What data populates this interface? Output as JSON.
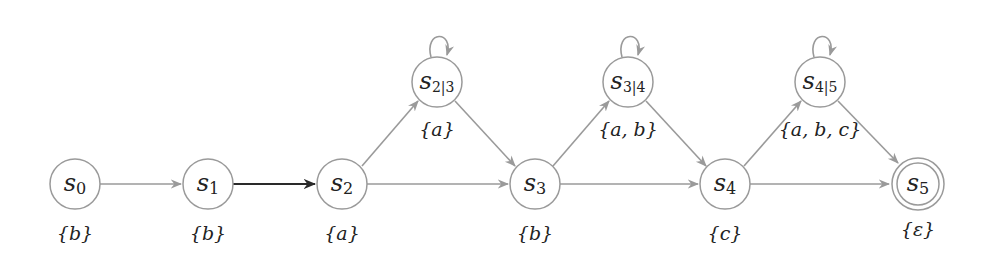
{
  "diagram": {
    "type": "state-automaton",
    "nodes": [
      {
        "id": "s0",
        "base": "s",
        "sub": "0",
        "set": "{b}",
        "x": 75,
        "y": 184,
        "accepting": false
      },
      {
        "id": "s1",
        "base": "s",
        "sub": "1",
        "set": "{b}",
        "x": 208,
        "y": 184,
        "accepting": false
      },
      {
        "id": "s2",
        "base": "s",
        "sub": "2",
        "set": "{a}",
        "x": 342,
        "y": 184,
        "accepting": false
      },
      {
        "id": "s2|3",
        "base": "s",
        "sub": "2|3",
        "set": "{a}",
        "x": 437,
        "y": 82,
        "accepting": false,
        "self_loop": true
      },
      {
        "id": "s3",
        "base": "s",
        "sub": "3",
        "set": "{b}",
        "x": 535,
        "y": 184,
        "accepting": false
      },
      {
        "id": "s3|4",
        "base": "s",
        "sub": "3|4",
        "set": "{a, b}",
        "x": 628,
        "y": 82,
        "accepting": false,
        "self_loop": true
      },
      {
        "id": "s4",
        "base": "s",
        "sub": "4",
        "set": "{c}",
        "x": 725,
        "y": 184,
        "accepting": false
      },
      {
        "id": "s4|5",
        "base": "s",
        "sub": "4|5",
        "set": "{a, b, c}",
        "x": 820,
        "y": 82,
        "accepting": false,
        "self_loop": true
      },
      {
        "id": "s5",
        "base": "s",
        "sub": "5",
        "set": "{ε}",
        "x": 918,
        "y": 184,
        "accepting": true
      }
    ],
    "edges": [
      {
        "from": "s0",
        "to": "s1",
        "style": "gray"
      },
      {
        "from": "s1",
        "to": "s2",
        "style": "dark"
      },
      {
        "from": "s2",
        "to": "s2|3",
        "style": "gray"
      },
      {
        "from": "s2",
        "to": "s3",
        "style": "gray"
      },
      {
        "from": "s2|3",
        "to": "s3",
        "style": "gray"
      },
      {
        "from": "s3",
        "to": "s3|4",
        "style": "gray"
      },
      {
        "from": "s3",
        "to": "s4",
        "style": "gray"
      },
      {
        "from": "s3|4",
        "to": "s4",
        "style": "gray"
      },
      {
        "from": "s4",
        "to": "s4|5",
        "style": "gray"
      },
      {
        "from": "s4",
        "to": "s5",
        "style": "gray"
      },
      {
        "from": "s4|5",
        "to": "s5",
        "style": "gray"
      },
      {
        "from": "s2|3",
        "to": "s2|3",
        "style": "gray"
      },
      {
        "from": "s3|4",
        "to": "s3|4",
        "style": "gray"
      },
      {
        "from": "s4|5",
        "to": "s4|5",
        "style": "gray"
      }
    ]
  },
  "labels": {
    "s0": {
      "base": "s",
      "sub": "0",
      "set": "{b}"
    },
    "s1": {
      "base": "s",
      "sub": "1",
      "set": "{b}"
    },
    "s2": {
      "base": "s",
      "sub": "2",
      "set": "{a}"
    },
    "s23": {
      "base": "s",
      "sub": "2|3",
      "set": "{a}"
    },
    "s3": {
      "base": "s",
      "sub": "3",
      "set": "{b}"
    },
    "s34": {
      "base": "s",
      "sub": "3|4",
      "set": "{a, b}"
    },
    "s4": {
      "base": "s",
      "sub": "4",
      "set": "{c}"
    },
    "s45": {
      "base": "s",
      "sub": "4|5",
      "set": "{a, b, c}"
    },
    "s5": {
      "base": "s",
      "sub": "5",
      "set": "{ε}"
    }
  },
  "colors": {
    "edge": "#9a9a9a",
    "edge_highlight": "#2a2a2a",
    "node_stroke": "#9a9a9a",
    "text": "#222222"
  }
}
